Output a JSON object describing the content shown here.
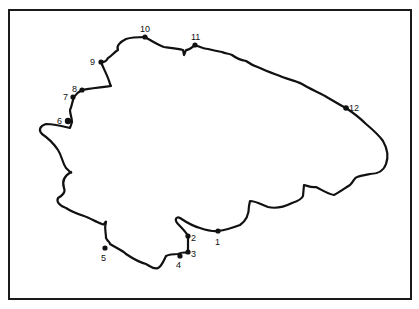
{
  "map": {
    "type": "island outline map with numbered sampling sites",
    "frame": {
      "x": 9,
      "y": 10,
      "width": 402,
      "height": 289
    },
    "colors": {
      "background": "#ffffff",
      "line": "#111111"
    },
    "sites": [
      {
        "id": "site-1",
        "label": "1",
        "x": 218,
        "y": 231,
        "label_x": 216,
        "label_y": 244
      },
      {
        "id": "site-2",
        "label": "2",
        "x": 188,
        "y": 236,
        "label_x": 192,
        "label_y": 241
      },
      {
        "id": "site-3",
        "label": "3",
        "x": 188,
        "y": 253,
        "label_x": 191,
        "label_y": 257
      },
      {
        "id": "site-4",
        "label": "4",
        "x": 180,
        "y": 256,
        "label_x": 176,
        "label_y": 268
      },
      {
        "id": "site-5",
        "label": "5",
        "x": 104,
        "y": 248,
        "label_x": 101,
        "label_y": 261
      },
      {
        "id": "site-6",
        "label": "6",
        "x": 68,
        "y": 121,
        "label_x": 57,
        "label_y": 124
      },
      {
        "id": "site-7",
        "label": "7",
        "x": 74,
        "y": 97,
        "label_x": 64,
        "label_y": 100
      },
      {
        "id": "site-8",
        "label": "8",
        "x": 82,
        "y": 90,
        "label_x": 72,
        "label_y": 92
      },
      {
        "id": "site-9",
        "label": "9",
        "x": 101,
        "y": 62,
        "label_x": 90,
        "label_y": 65
      },
      {
        "id": "site-10",
        "label": "10",
        "x": 145,
        "y": 37,
        "label_x": 140,
        "label_y": 32
      },
      {
        "id": "site-11",
        "label": "11",
        "x": 195,
        "y": 45,
        "label_x": 192,
        "label_y": 40
      },
      {
        "id": "site-12",
        "label": "12",
        "x": 346,
        "y": 108,
        "label_x": 349,
        "label_y": 111
      }
    ]
  }
}
